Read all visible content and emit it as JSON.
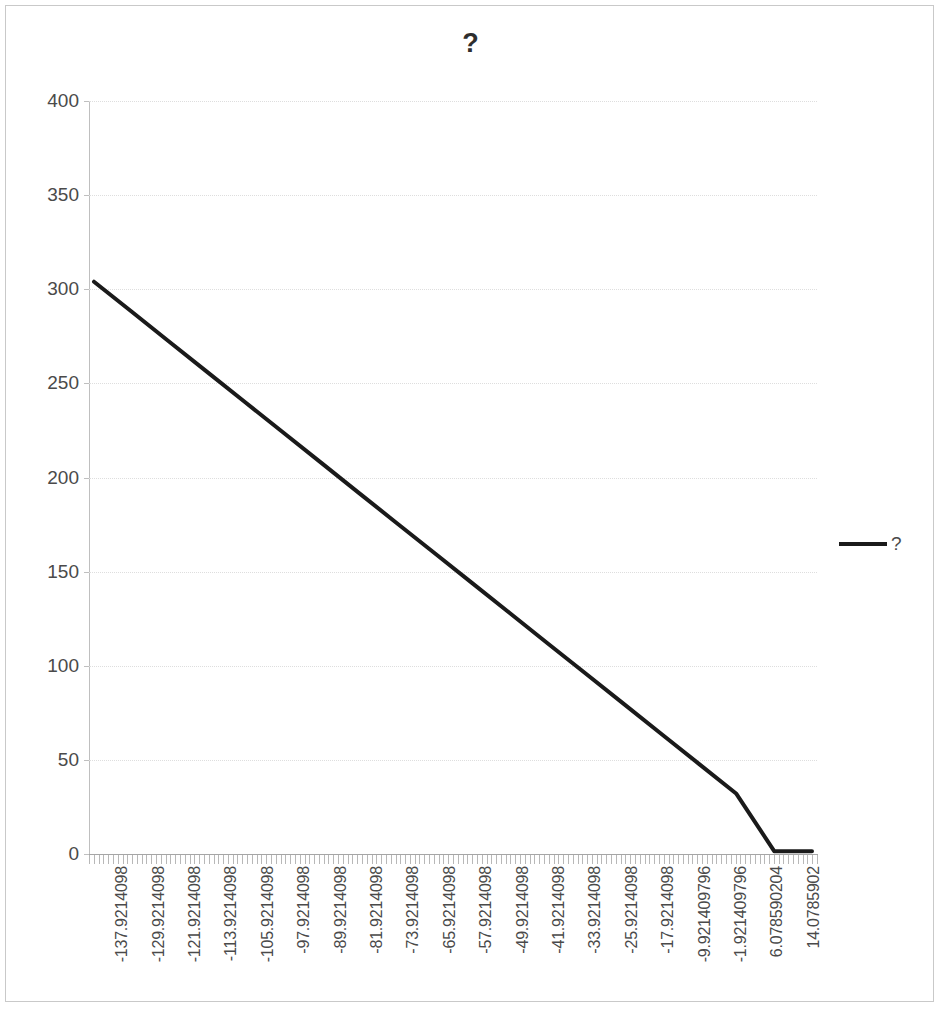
{
  "chart_frame": {
    "border_color": "#c9c9c9",
    "background": "#ffffff"
  },
  "title": "?",
  "legend": {
    "position": "right",
    "entries": [
      {
        "label": "?",
        "color": "#1a1a1a",
        "marker": "line-swatch"
      }
    ]
  },
  "axes": {
    "y": {
      "min": 0,
      "max": 400,
      "step": 50,
      "tick_labels": [
        "0",
        "50",
        "100",
        "150",
        "200",
        "250",
        "300",
        "350",
        "400"
      ],
      "grid": true,
      "grid_color": "#dedede",
      "label_color": "#4a4a4a"
    },
    "x": {
      "tick_labels": [
        "-137.9214098",
        "-129.9214098",
        "-121.9214098",
        "-113.9214098",
        "-105.9214098",
        "-97.9214098",
        "-89.9214098",
        "-81.9214098",
        "-73.9214098",
        "-65.9214098",
        "-57.9214098",
        "-49.9214098",
        "-41.9214098",
        "-33.9214098",
        "-25.9214098",
        "-17.9214098",
        "-9.921409796",
        "-1.921409796",
        "6.078590204",
        "14.0785902"
      ],
      "label_rotation": -90,
      "minor_tick_count": 152,
      "label_color": "#4a4a4a",
      "grid": false
    }
  },
  "chart_data": {
    "type": "line",
    "title": "?",
    "xlabel": "",
    "ylabel": "",
    "ylim": [
      0,
      400
    ],
    "grid": true,
    "legend_position": "right",
    "x_tick_labels": [
      "-137.9214098",
      "-129.9214098",
      "-121.9214098",
      "-113.9214098",
      "-105.9214098",
      "-97.9214098",
      "-89.9214098",
      "-81.9214098",
      "-73.9214098",
      "-65.9214098",
      "-57.9214098",
      "-49.9214098",
      "-41.9214098",
      "-33.9214098",
      "-25.9214098",
      "-17.9214098",
      "-9.921409796",
      "-1.921409796",
      "6.078590204",
      "14.0785902"
    ],
    "series": [
      {
        "name": "?",
        "color": "#1a1a1a",
        "line_width": 4,
        "x": [
          -137.9214098,
          -129.9214098,
          -121.9214098,
          -113.9214098,
          -105.9214098,
          -97.9214098,
          -89.9214098,
          -81.9214098,
          -73.9214098,
          -65.9214098,
          -57.9214098,
          -49.9214098,
          -41.9214098,
          -33.9214098,
          -25.9214098,
          -17.9214098,
          -9.921409796,
          -1.921409796,
          6.078590204,
          14.0785902
        ],
        "values": [
          304,
          288,
          272,
          256,
          240,
          224,
          208,
          192,
          176,
          160,
          144,
          128,
          112,
          96,
          80,
          64,
          48,
          32,
          1.5,
          1.5
        ]
      }
    ]
  }
}
